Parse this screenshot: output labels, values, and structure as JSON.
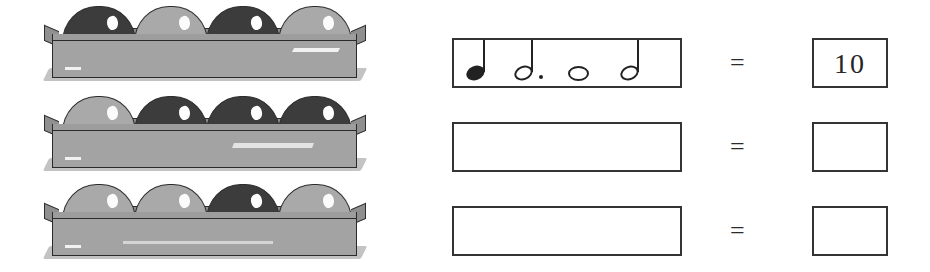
{
  "worksheet": {
    "title": "Egg Carton Rhythm Matching Worksheet",
    "equals_symbol": "=",
    "cartons": [
      {
        "label": "carton-row-1",
        "eggs": [
          {
            "shade": "dark"
          },
          {
            "shade": "light"
          },
          {
            "shade": "dark"
          },
          {
            "shade": "light"
          }
        ]
      },
      {
        "label": "carton-row-2",
        "eggs": [
          {
            "shade": "light"
          },
          {
            "shade": "dark"
          },
          {
            "shade": "dark"
          },
          {
            "shade": "dark"
          }
        ]
      },
      {
        "label": "carton-row-3",
        "eggs": [
          {
            "shade": "light"
          },
          {
            "shade": "light"
          },
          {
            "shade": "dark"
          },
          {
            "shade": "light"
          }
        ]
      }
    ],
    "rows": [
      {
        "label": "equation-row-1",
        "notes": [
          {
            "name": "quarter-note",
            "head": "filled",
            "stem": true,
            "dot": false
          },
          {
            "name": "dotted-half-note",
            "head": "hollow",
            "stem": true,
            "dot": true
          },
          {
            "name": "whole-note",
            "head": "whole",
            "stem": false,
            "dot": false
          },
          {
            "name": "half-note",
            "head": "hollow",
            "stem": true,
            "dot": false
          }
        ],
        "answer": "10"
      },
      {
        "label": "equation-row-2",
        "notes": [],
        "answer": ""
      },
      {
        "label": "equation-row-3",
        "notes": [],
        "answer": ""
      }
    ]
  },
  "colors": {
    "ink": "#2a2a2a",
    "carton_gray": "#a3a3a3",
    "egg_dark": "#3c3c3c",
    "egg_light": "#a9a9a9",
    "paper": "#ffffff",
    "shadow": "#b9b9b9"
  }
}
